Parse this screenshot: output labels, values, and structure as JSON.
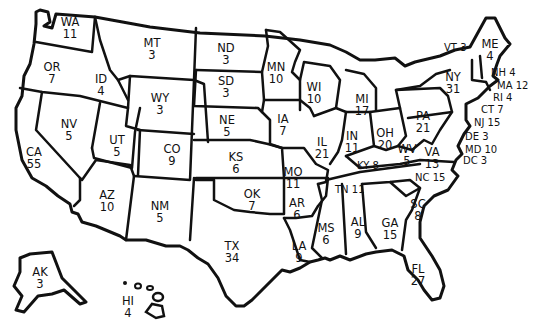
{
  "map": {
    "title": "",
    "colors": {
      "fill": "#ffffff",
      "border": "#111111",
      "text": "#111111"
    },
    "states": [
      {
        "abbr": "WA",
        "votes": "11",
        "x": 70,
        "y": 16
      },
      {
        "abbr": "OR",
        "votes": "7",
        "x": 52,
        "y": 61
      },
      {
        "abbr": "CA",
        "votes": "55",
        "x": 34,
        "y": 146
      },
      {
        "abbr": "NV",
        "votes": "5",
        "x": 69,
        "y": 118
      },
      {
        "abbr": "ID",
        "votes": "4",
        "x": 101,
        "y": 73
      },
      {
        "abbr": "MT",
        "votes": "3",
        "x": 152,
        "y": 37
      },
      {
        "abbr": "WY",
        "votes": "3",
        "x": 160,
        "y": 92
      },
      {
        "abbr": "UT",
        "votes": "5",
        "x": 117,
        "y": 134
      },
      {
        "abbr": "CO",
        "votes": "9",
        "x": 172,
        "y": 143
      },
      {
        "abbr": "AZ",
        "votes": "10",
        "x": 107,
        "y": 189
      },
      {
        "abbr": "NM",
        "votes": "5",
        "x": 160,
        "y": 200
      },
      {
        "abbr": "ND",
        "votes": "3",
        "x": 226,
        "y": 42
      },
      {
        "abbr": "SD",
        "votes": "3",
        "x": 226,
        "y": 75
      },
      {
        "abbr": "NE",
        "votes": "5",
        "x": 227,
        "y": 114
      },
      {
        "abbr": "KS",
        "votes": "6",
        "x": 236,
        "y": 151
      },
      {
        "abbr": "OK",
        "votes": "7",
        "x": 252,
        "y": 188
      },
      {
        "abbr": "TX",
        "votes": "34",
        "x": 232,
        "y": 240
      },
      {
        "abbr": "MN",
        "votes": "10",
        "x": 276,
        "y": 61
      },
      {
        "abbr": "IA",
        "votes": "7",
        "x": 283,
        "y": 113
      },
      {
        "abbr": "MO",
        "votes": "11",
        "x": 293,
        "y": 166
      },
      {
        "abbr": "AR",
        "votes": "6",
        "x": 297,
        "y": 197
      },
      {
        "abbr": "LA",
        "votes": "9",
        "x": 299,
        "y": 240
      },
      {
        "abbr": "WI",
        "votes": "10",
        "x": 314,
        "y": 81
      },
      {
        "abbr": "IL",
        "votes": "21",
        "x": 322,
        "y": 136
      },
      {
        "abbr": "MI",
        "votes": "17",
        "x": 362,
        "y": 93
      },
      {
        "abbr": "IN",
        "votes": "11",
        "x": 352,
        "y": 130
      },
      {
        "abbr": "OH",
        "votes": "20",
        "x": 385,
        "y": 127
      },
      {
        "abbr": "MS",
        "votes": "6",
        "x": 326,
        "y": 222
      },
      {
        "abbr": "AL",
        "votes": "9",
        "x": 358,
        "y": 216
      },
      {
        "abbr": "GA",
        "votes": "15",
        "x": 390,
        "y": 217
      },
      {
        "abbr": "FL",
        "votes": "27",
        "x": 418,
        "y": 263
      },
      {
        "abbr": "SC",
        "votes": "8",
        "x": 418,
        "y": 198
      },
      {
        "abbr": "PA",
        "votes": "21",
        "x": 423,
        "y": 110
      },
      {
        "abbr": "NY",
        "votes": "31",
        "x": 453,
        "y": 71
      },
      {
        "abbr": "WV",
        "votes": "5",
        "x": 407,
        "y": 143
      },
      {
        "abbr": "VA",
        "votes": "13",
        "x": 432,
        "y": 146
      },
      {
        "abbr": "ME",
        "votes": "4",
        "x": 490,
        "y": 38
      },
      {
        "abbr": "AK",
        "votes": "3",
        "x": 40,
        "y": 266
      },
      {
        "abbr": "HI",
        "votes": "4",
        "x": 128,
        "y": 295
      }
    ],
    "inline_labels": [
      {
        "abbr": "VT",
        "votes": "3",
        "text": "VT 3",
        "x": 444,
        "y": 42
      },
      {
        "abbr": "NH",
        "votes": "4",
        "text": "NH 4",
        "x": 491,
        "y": 67
      },
      {
        "abbr": "MA",
        "votes": "12",
        "text": "MA 12",
        "x": 497,
        "y": 80
      },
      {
        "abbr": "RI",
        "votes": "4",
        "text": "RI 4",
        "x": 493,
        "y": 92
      },
      {
        "abbr": "CT",
        "votes": "7",
        "text": "CT 7",
        "x": 481,
        "y": 104
      },
      {
        "abbr": "NJ",
        "votes": "15",
        "text": "NJ 15",
        "x": 474,
        "y": 117
      },
      {
        "abbr": "DE",
        "votes": "3",
        "text": "DE 3",
        "x": 465,
        "y": 131
      },
      {
        "abbr": "MD",
        "votes": "10",
        "text": "MD 10",
        "x": 465,
        "y": 144
      },
      {
        "abbr": "DC",
        "votes": "3",
        "text": "DC 3",
        "x": 463,
        "y": 155
      },
      {
        "abbr": "KY",
        "votes": "8",
        "text": "KY 8",
        "x": 357,
        "y": 160
      },
      {
        "abbr": "TN",
        "votes": "11",
        "text": "TN 11",
        "x": 335,
        "y": 184
      },
      {
        "abbr": "NC",
        "votes": "15",
        "text": "NC 15",
        "x": 415,
        "y": 172
      }
    ]
  }
}
